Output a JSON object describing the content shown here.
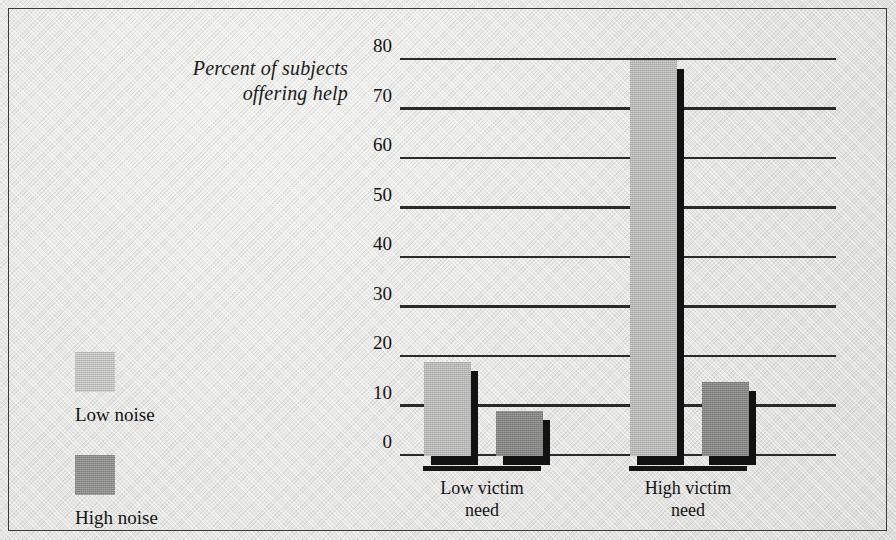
{
  "chart_data": {
    "type": "bar",
    "title": "",
    "xlabel": "",
    "ylabel": "Percent of subjects offering help",
    "ylabel_line1": "Percent of subjects",
    "ylabel_line2": "offering help",
    "categories": [
      "Low victim need",
      "High victim need"
    ],
    "category_lines": [
      {
        "line1": "Low victim",
        "line2": "need"
      },
      {
        "line1": "High victim",
        "line2": "need"
      }
    ],
    "series": [
      {
        "name": "Low noise",
        "values": [
          19,
          80
        ],
        "color": "#b4b4b2"
      },
      {
        "name": "High noise",
        "values": [
          9,
          15
        ],
        "color": "#848482"
      }
    ],
    "ylim": [
      0,
      80
    ],
    "yticks": [
      0,
      10,
      20,
      30,
      40,
      50,
      60,
      70,
      80
    ],
    "ytick_labels": [
      "0",
      "10",
      "20",
      "30",
      "40",
      "50",
      "60",
      "70",
      "80"
    ],
    "grid": true,
    "grid_color": "#2a2a2a",
    "legend_position": "left",
    "legend": [
      "Low noise",
      "High noise"
    ],
    "background_color": "#e6e6e4",
    "text_color": "#141414"
  },
  "legend": {
    "items": [
      {
        "label": "Low noise",
        "swatch": "low-noise-swatch"
      },
      {
        "label": "High noise",
        "swatch": "high-noise-swatch"
      }
    ]
  }
}
